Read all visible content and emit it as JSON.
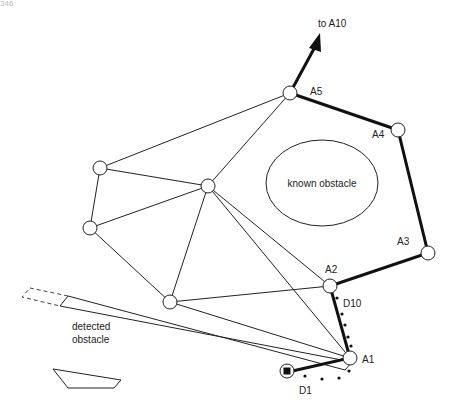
{
  "page_number": "346",
  "labels": {
    "to_a10": "to A10",
    "a5": "A5",
    "a4": "A4",
    "a3": "A3",
    "a2": "A2",
    "a1": "A1",
    "d10": "D10",
    "d1": "D1",
    "known_obstacle": "known obstacle",
    "detected_obstacle_line1": "detected",
    "detected_obstacle_line2": "obstacle"
  },
  "colors": {
    "stroke": "#222222",
    "background": "#ffffff"
  }
}
